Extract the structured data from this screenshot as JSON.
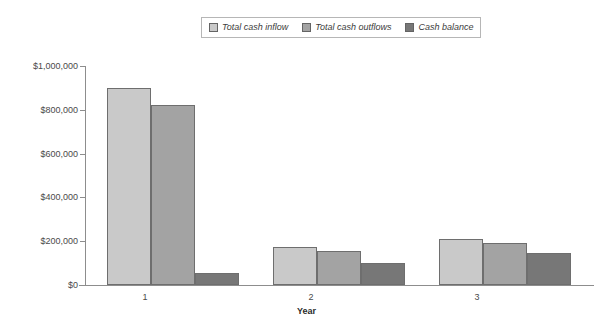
{
  "chart_data": {
    "type": "bar",
    "title": "",
    "xlabel": "Year",
    "ylabel": "",
    "categories": [
      "1",
      "2",
      "3"
    ],
    "series": [
      {
        "name": "Total cash inflow",
        "color": "#c9c9c9",
        "values": [
          900000,
          175000,
          210000
        ]
      },
      {
        "name": "Total cash outflows",
        "color": "#a3a3a3",
        "values": [
          820000,
          157000,
          192000
        ]
      },
      {
        "name": "Cash balance",
        "color": "#777777",
        "values": [
          55000,
          100000,
          148000
        ]
      }
    ],
    "ylim": [
      0,
      1000000
    ],
    "yticks": [
      0,
      200000,
      400000,
      600000,
      800000,
      1000000
    ],
    "ytick_labels": [
      "$0",
      "$200,000",
      "$400,000",
      "$600,000",
      "$800,000",
      "$1,000,000"
    ],
    "grid": false,
    "legend_position": "top-center"
  },
  "legend": {
    "items": [
      {
        "label": "Total cash inflow",
        "swatch": "#c9c9c9"
      },
      {
        "label": "Total cash outflows",
        "swatch": "#a3a3a3"
      },
      {
        "label": "Cash balance",
        "swatch": "#777777"
      }
    ]
  },
  "axis": {
    "x_title": "Year",
    "x_tick_labels": [
      "1",
      "2",
      "3"
    ],
    "y_tick_labels": [
      "$1,000,000",
      "$800,000",
      "$600,000",
      "$400,000",
      "$200,000",
      "$0"
    ]
  },
  "colors": {
    "series_1": "#c9c9c9",
    "series_2": "#a3a3a3",
    "series_3": "#777777",
    "axis": "#8d8d8d",
    "bar_border": "#6e6e6e",
    "legend_border": "#b6b6b6",
    "background": "#ffffff"
  }
}
